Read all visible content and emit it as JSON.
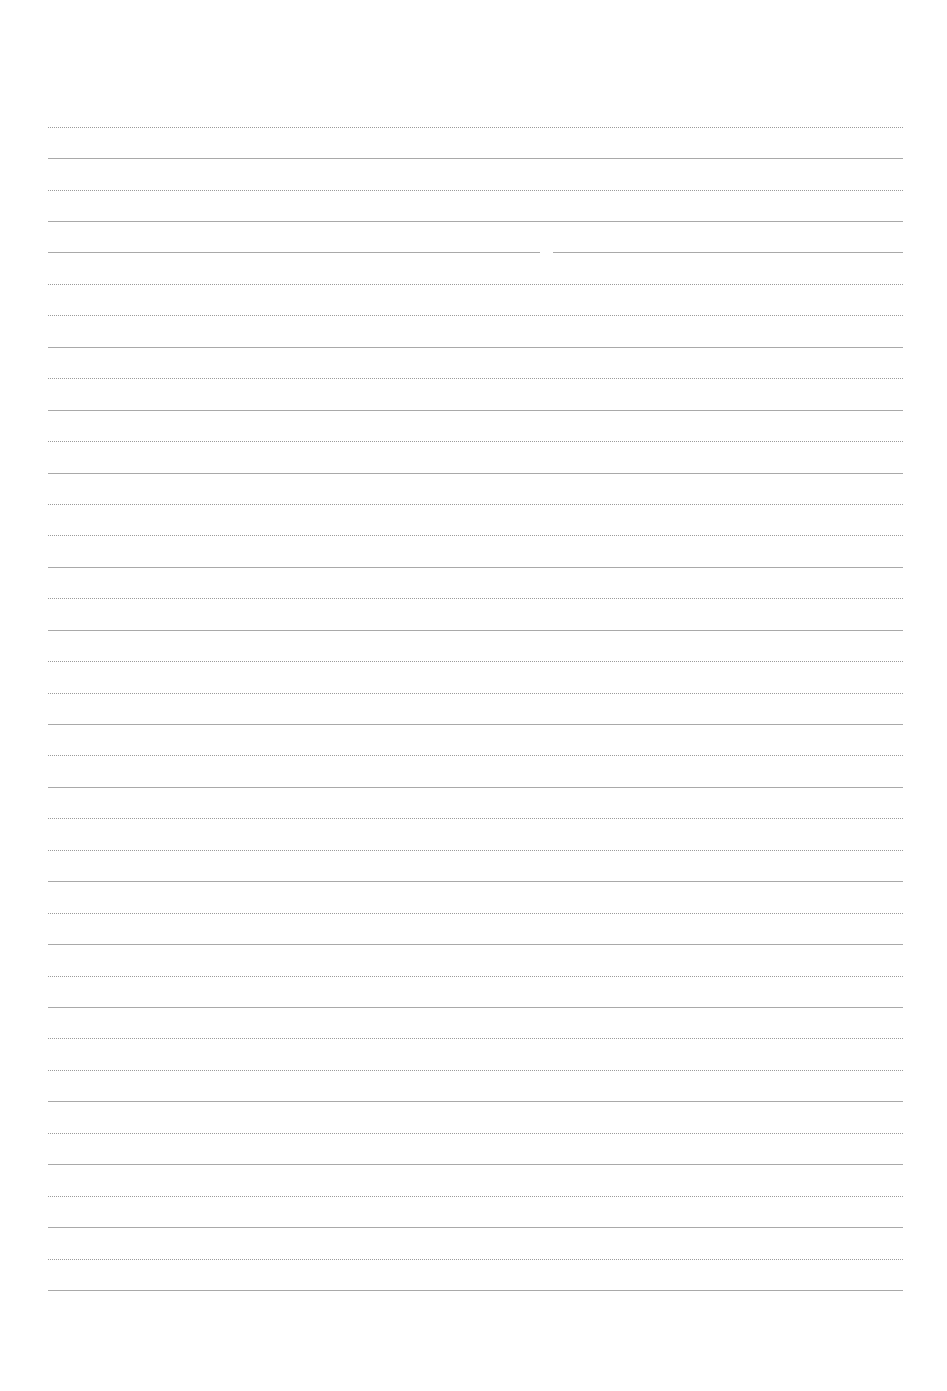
{
  "document": {
    "type": "lined-paper",
    "background_color": "#ffffff",
    "line_color": "#9a9a9a",
    "line_left_x": 48,
    "line_right_x": 903,
    "line_count": 38,
    "line_spacing_px": 31.4,
    "line_y_positions": [
      127,
      158,
      190,
      221,
      252,
      284,
      315,
      347,
      378,
      410,
      441,
      473,
      504,
      535,
      567,
      598,
      630,
      661,
      693,
      724,
      755,
      787,
      818,
      850,
      881,
      913,
      944,
      976,
      1007,
      1038,
      1070,
      1101,
      1133,
      1164,
      1196,
      1227,
      1259,
      1290
    ],
    "line_styles": [
      "dotted",
      "solid",
      "dotted",
      "solid",
      "solid",
      "dotted",
      "dotted",
      "solid",
      "dotted",
      "solid",
      "dotted",
      "solid",
      "dotted",
      "dotted",
      "solid",
      "dotted",
      "solid",
      "dotted",
      "dotted",
      "solid",
      "dotted",
      "solid",
      "dotted",
      "dotted",
      "solid",
      "dotted",
      "solid",
      "dotted",
      "solid",
      "dotted",
      "dotted",
      "solid",
      "dotted",
      "solid",
      "dotted",
      "solid",
      "dotted",
      "solid"
    ],
    "gaps": [
      {
        "line_index": 4,
        "x_start": 540,
        "x_end": 553
      }
    ]
  }
}
